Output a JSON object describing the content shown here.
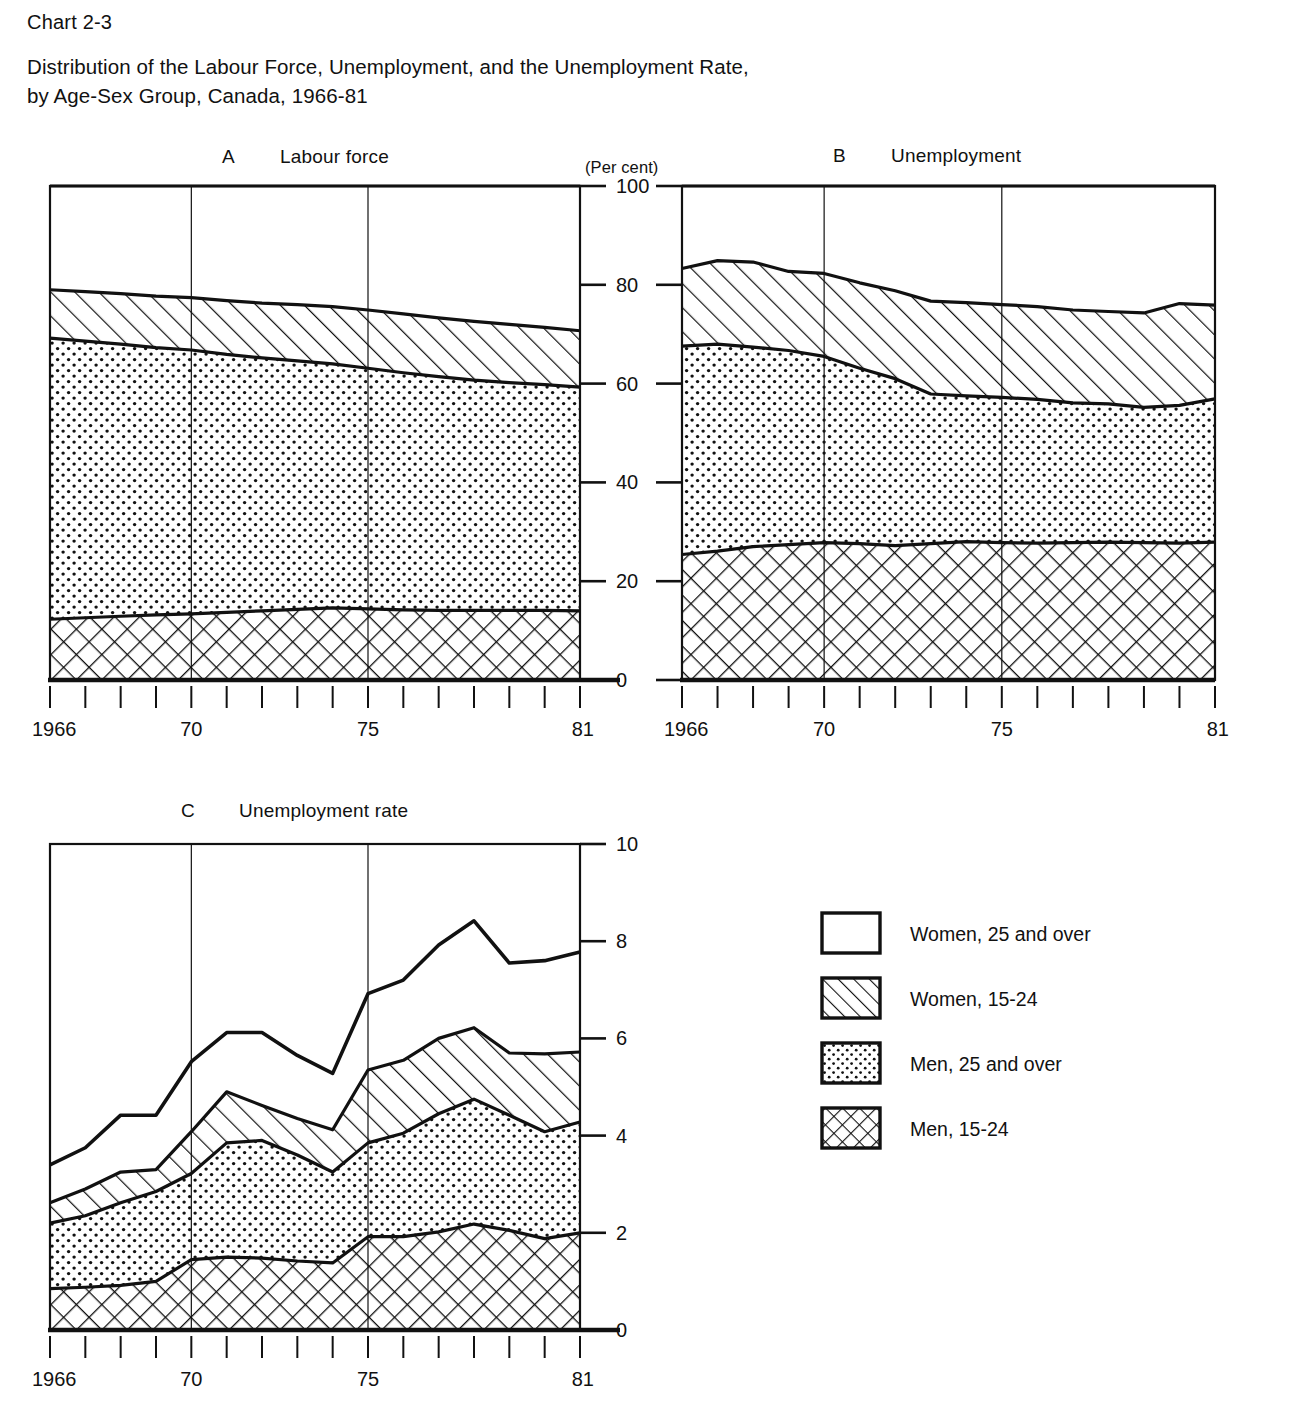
{
  "header": {
    "chart_number": "Chart 2-3",
    "title": "Distribution of the Labour Force, Unemployment, and the Unemployment Rate,\nby Age-Sex Group, Canada, 1966-81"
  },
  "panels": {
    "a": {
      "letter": "A",
      "caption": "Labour force"
    },
    "b": {
      "letter": "B",
      "caption": "Unemployment"
    },
    "c": {
      "letter": "C",
      "caption": "Unemployment rate"
    }
  },
  "axis": {
    "units_note": "(Per cent)",
    "percent_ticks": [
      "0",
      "20",
      "40",
      "60",
      "80",
      "100"
    ],
    "rate_ticks": [
      "0",
      "2",
      "4",
      "6",
      "8",
      "10"
    ],
    "year_first": "1966",
    "year_mid1": "70",
    "year_mid2": "75",
    "year_last": "81"
  },
  "legend": {
    "items": [
      {
        "label": "Women, 25 and over",
        "pattern": "blank"
      },
      {
        "label": "Women, 15-24",
        "pattern": "diagonal"
      },
      {
        "label": "Men, 25 and over",
        "pattern": "dots"
      },
      {
        "label": "Men, 15-24",
        "pattern": "crosshatch"
      }
    ]
  },
  "chart_data": [
    {
      "id": "panel-a",
      "type": "area",
      "title": "A   Labour force",
      "xlabel": "",
      "ylabel": "(Per cent)",
      "x": [
        1966,
        1967,
        1968,
        1969,
        1970,
        1971,
        1972,
        1973,
        1974,
        1975,
        1976,
        1977,
        1978,
        1979,
        1980,
        1981
      ],
      "xlim": [
        1966,
        1981
      ],
      "ylim": [
        0,
        100
      ],
      "yticks": [
        0,
        20,
        40,
        60,
        80,
        100
      ],
      "stacked": true,
      "grid": false,
      "legend_position": "outside-right",
      "series": [
        {
          "name": "Men, 15-24",
          "pattern": "crosshatch",
          "values": [
            12.3,
            12.6,
            12.9,
            13.2,
            13.4,
            13.7,
            14.0,
            14.3,
            14.6,
            14.4,
            14.2,
            14.1,
            14.1,
            14.1,
            14.1,
            14.0
          ]
        },
        {
          "name": "Men, 25 and over",
          "pattern": "dots",
          "values": [
            56.9,
            56.0,
            55.1,
            54.1,
            53.4,
            52.2,
            51.2,
            50.3,
            49.4,
            48.7,
            48.0,
            47.3,
            46.6,
            46.1,
            45.7,
            45.3
          ]
        },
        {
          "name": "Women, 15-24",
          "pattern": "diagonal",
          "values": [
            9.8,
            10.0,
            10.2,
            10.4,
            10.6,
            10.9,
            11.1,
            11.4,
            11.6,
            11.8,
            11.9,
            11.9,
            11.9,
            11.8,
            11.6,
            11.4
          ]
        },
        {
          "name": "Women, 25 and over",
          "pattern": "blank",
          "values": [
            21.0,
            21.4,
            21.8,
            22.3,
            22.6,
            23.2,
            23.7,
            24.0,
            24.4,
            25.1,
            25.9,
            26.7,
            27.4,
            28.0,
            28.6,
            29.3
          ]
        }
      ]
    },
    {
      "id": "panel-b",
      "type": "area",
      "title": "B   Unemployment",
      "xlabel": "",
      "ylabel": "(Per cent)",
      "x": [
        1966,
        1967,
        1968,
        1969,
        1970,
        1971,
        1972,
        1973,
        1974,
        1975,
        1976,
        1977,
        1978,
        1979,
        1980,
        1981
      ],
      "xlim": [
        1966,
        1981
      ],
      "ylim": [
        0,
        100
      ],
      "yticks": [
        0,
        20,
        40,
        60,
        80,
        100
      ],
      "stacked": true,
      "grid": false,
      "legend_position": "outside-right",
      "series": [
        {
          "name": "Men, 15-24",
          "pattern": "crosshatch",
          "values": [
            25.4,
            26.1,
            27.0,
            27.4,
            27.8,
            27.6,
            27.2,
            27.6,
            28.0,
            27.8,
            27.7,
            27.8,
            27.9,
            27.8,
            27.7,
            27.9
          ]
        },
        {
          "name": "Men, 25 and over",
          "pattern": "dots",
          "values": [
            42.2,
            41.9,
            40.4,
            39.3,
            37.7,
            35.5,
            33.8,
            30.3,
            29.5,
            29.4,
            29.1,
            28.3,
            28.0,
            27.4,
            27.9,
            29.0
          ]
        },
        {
          "name": "Women, 15-24",
          "pattern": "diagonal",
          "values": [
            15.7,
            16.9,
            17.2,
            16.0,
            16.8,
            17.3,
            17.8,
            18.8,
            18.9,
            18.8,
            18.8,
            18.8,
            18.7,
            19.1,
            20.6,
            19.0
          ]
        },
        {
          "name": "Women, 25 and over",
          "pattern": "blank",
          "values": [
            16.7,
            15.1,
            15.4,
            17.3,
            17.7,
            19.6,
            21.2,
            23.3,
            23.6,
            24.0,
            24.4,
            25.1,
            25.4,
            25.7,
            23.8,
            24.1
          ]
        }
      ]
    },
    {
      "id": "panel-c",
      "type": "line",
      "title": "C   Unemployment rate",
      "xlabel": "",
      "ylabel": "",
      "x": [
        1966,
        1967,
        1968,
        1969,
        1970,
        1971,
        1972,
        1973,
        1974,
        1975,
        1976,
        1977,
        1978,
        1979,
        1980,
        1981
      ],
      "xlim": [
        1966,
        1981
      ],
      "ylim": [
        0,
        10
      ],
      "yticks": [
        0,
        2,
        4,
        6,
        8,
        10
      ],
      "stacked": true,
      "grid": false,
      "legend_position": "outside-right",
      "note": "Values are cumulative band tops as drawn on the chart (bottom band = Men 15-24).",
      "series": [
        {
          "name": "Men, 15-24",
          "pattern": "crosshatch",
          "values": [
            0.85,
            0.88,
            0.92,
            1.0,
            1.45,
            1.5,
            1.48,
            1.42,
            1.38,
            1.92,
            1.92,
            2.02,
            2.18,
            2.05,
            1.88,
            2.0
          ]
        },
        {
          "name": "Men, 25 and over",
          "pattern": "dots",
          "values": [
            2.2,
            2.35,
            2.62,
            2.85,
            3.22,
            3.85,
            3.9,
            3.6,
            3.25,
            3.85,
            4.05,
            4.45,
            4.75,
            4.42,
            4.08,
            4.28
          ]
        },
        {
          "name": "Women, 15-24",
          "pattern": "diagonal",
          "values": [
            2.62,
            2.9,
            3.25,
            3.3,
            4.08,
            4.9,
            4.62,
            4.35,
            4.12,
            5.35,
            5.55,
            6.0,
            6.22,
            5.7,
            5.68,
            5.72
          ]
        },
        {
          "name": "Women, 25 and over",
          "pattern": "blank",
          "values": [
            3.4,
            3.75,
            4.42,
            4.42,
            5.52,
            6.12,
            6.12,
            5.65,
            5.28,
            6.92,
            7.2,
            7.92,
            8.42,
            7.55,
            7.6,
            7.78
          ]
        }
      ]
    }
  ]
}
